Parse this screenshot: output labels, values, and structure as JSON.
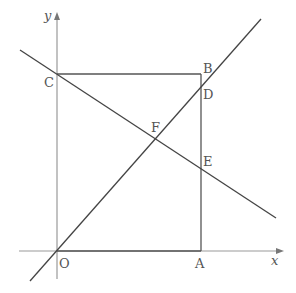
{
  "diagram": {
    "type": "coordinate-geometry",
    "axes": {
      "x_label": "x",
      "y_label": "y",
      "origin_label": "O"
    },
    "points": {
      "O": {
        "label": "O",
        "px": [
          57,
          251
        ]
      },
      "A": {
        "label": "A",
        "px": [
          201,
          251
        ]
      },
      "B": {
        "label": "B",
        "px": [
          201,
          74
        ]
      },
      "C": {
        "label": "C",
        "px": [
          57,
          74
        ]
      },
      "D": {
        "label": "D",
        "px": [
          201,
          88
        ]
      },
      "E": {
        "label": "E",
        "px": [
          201,
          168
        ]
      },
      "F": {
        "label": "F",
        "px": [
          154,
          136
        ]
      }
    },
    "shapes": {
      "square": [
        "O",
        "A",
        "B",
        "C"
      ],
      "line_1": {
        "through": [
          "O",
          "F",
          "D"
        ],
        "from_px": [
          30,
          281
        ],
        "to_px": [
          261,
          19
        ]
      },
      "line_2": {
        "through": [
          "C",
          "F",
          "E"
        ],
        "from_px": [
          20,
          50
        ],
        "to_px": [
          276,
          218
        ]
      }
    },
    "colors": {
      "axis": "#999999",
      "line": "#444444",
      "square": "#555555",
      "label": "#555555"
    }
  }
}
